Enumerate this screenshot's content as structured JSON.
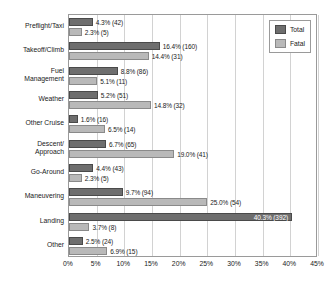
{
  "chart_data": {
    "type": "bar",
    "orientation": "horizontal",
    "grouped": true,
    "title": "",
    "xlabel": "",
    "ylabel": "",
    "xlim": [
      0,
      45
    ],
    "xtick_labels": [
      "0%",
      "5%",
      "10%",
      "15%",
      "20%",
      "25%",
      "30%",
      "35%",
      "40%",
      "45%"
    ],
    "xtick_values": [
      0,
      5,
      10,
      15,
      20,
      25,
      30,
      35,
      40,
      45
    ],
    "grid": "vertical",
    "legend_position": "top-right-inside",
    "categories": [
      "Preflight/Taxi",
      "Takeoff/Climb",
      "Fuel\nManagement",
      "Weather",
      "Other Cruise",
      "Descent/\nApproach",
      "Go-Around",
      "Maneuvering",
      "Landing",
      "Other"
    ],
    "series": [
      {
        "name": "Total",
        "color": "#6e6e6e",
        "values": [
          4.3,
          16.4,
          8.8,
          5.2,
          1.6,
          6.7,
          4.4,
          9.7,
          40.3,
          2.5
        ],
        "counts": [
          42,
          160,
          86,
          51,
          16,
          65,
          43,
          94,
          392,
          24
        ],
        "labels": [
          "4.3% (42)",
          "16.4% (160)",
          "8.8% (86)",
          "5.2% (51)",
          "1.6% (16)",
          "6.7% (65)",
          "4.4% (43)",
          "9.7% (94)",
          "40.3% (392)",
          "2.5% (24)"
        ]
      },
      {
        "name": "Fatal",
        "color": "#b9b9b9",
        "values": [
          2.3,
          14.4,
          5.1,
          14.8,
          6.5,
          19.0,
          2.3,
          25.0,
          3.7,
          6.9
        ],
        "counts": [
          5,
          31,
          11,
          32,
          14,
          41,
          5,
          54,
          8,
          15
        ],
        "labels": [
          "2.3% (5)",
          "14.4% (31)",
          "5.1% (11)",
          "14.8% (32)",
          "6.5% (14)",
          "19.0% (41)",
          "2.3% (5)",
          "25.0% (54)",
          "3.7% (8)",
          "6.9% (15)"
        ]
      }
    ],
    "legend": [
      {
        "label": "Total",
        "color": "#6e6e6e"
      },
      {
        "label": "Fatal",
        "color": "#b9b9b9"
      }
    ]
  }
}
